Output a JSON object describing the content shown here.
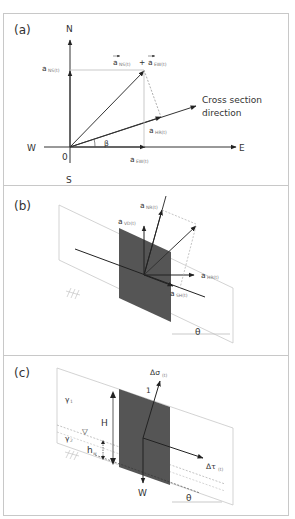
{
  "figure": {
    "panels": [
      {
        "id": "a",
        "label": "(a)",
        "compass": {
          "north": "N",
          "south": "S",
          "east": "E",
          "west": "W",
          "origin": "0"
        },
        "vectors": {
          "ns": {
            "base": "a",
            "sub": "NS(t)"
          },
          "ew": {
            "base": "a",
            "sub": "EW(t)"
          },
          "hr": {
            "base": "a",
            "sub": "HR(t)"
          },
          "sum": {
            "a1": "a",
            "s1": "NS(t)",
            "plus": "+",
            "a2": "a",
            "s2": "EW(t)"
          }
        },
        "angle": "β",
        "cross_section_line1": "Cross section",
        "cross_section_line2": "direction"
      },
      {
        "id": "b",
        "label": "(b)",
        "vectors": {
          "nr": {
            "base": "a",
            "sub": "NR(t)"
          },
          "vd": {
            "base": "a",
            "sub": "VD(t)"
          },
          "hr": {
            "base": "a",
            "sub": "HR(t)"
          },
          "sh": {
            "base": "a",
            "sub": "SH(t)"
          }
        },
        "angle": "θ"
      },
      {
        "id": "c",
        "label": "(c)",
        "gamma1": {
          "base": "γ",
          "sub": "1"
        },
        "gamma2": {
          "base": "γ",
          "sub": "2"
        },
        "height": "H",
        "water_depth": {
          "base": "h",
          "sub": "w"
        },
        "normal_stress": {
          "base": "Δσ",
          "sub": "(t)"
        },
        "shear_stress": {
          "base": "Δτ",
          "sub": "(t)"
        },
        "slope_ratio": "1",
        "weight": "W",
        "angle": "θ",
        "water_table_symbol": "▽"
      }
    ]
  }
}
